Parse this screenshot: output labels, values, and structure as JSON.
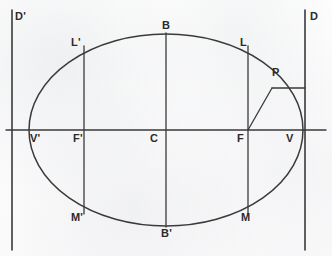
{
  "figure": {
    "width": 332,
    "height": 256,
    "background_color": "#fdfdfd",
    "stroke_color": "#333333",
    "label_color": "#2b2b2b"
  },
  "geometry": {
    "center": {
      "x": 166,
      "y": 130
    },
    "semi_major_axis": 137,
    "semi_minor_axis": 96,
    "major_axis_y": 130,
    "minor_axis_x": 166,
    "focus_right_x": 248,
    "focus_left_x": 84,
    "directrix_right_x": 305,
    "directrix_left_x": 12,
    "directrix_top_y": 10,
    "directrix_bottom_y": 250,
    "point_p": {
      "x": 272,
      "y": 88
    },
    "p_foot_on_directrix": {
      "x": 305,
      "y": 88
    }
  },
  "labels": [
    {
      "id": "D-prime",
      "text": "D'",
      "x": 15,
      "y": 11,
      "name": "label-d-prime"
    },
    {
      "id": "D",
      "text": "D",
      "x": 310,
      "y": 11,
      "name": "label-d"
    },
    {
      "id": "B",
      "text": "B",
      "x": 162,
      "y": 20,
      "name": "label-b"
    },
    {
      "id": "B-prime",
      "text": "B'",
      "x": 161,
      "y": 228,
      "name": "label-b-prime"
    },
    {
      "id": "L-prime",
      "text": "L'",
      "x": 71,
      "y": 37,
      "name": "label-l-prime"
    },
    {
      "id": "L",
      "text": "L",
      "x": 240,
      "y": 37,
      "name": "label-l"
    },
    {
      "id": "M-prime",
      "text": "M'",
      "x": 71,
      "y": 212,
      "name": "label-m-prime"
    },
    {
      "id": "M",
      "text": "M",
      "x": 241,
      "y": 212,
      "name": "label-m"
    },
    {
      "id": "V-prime",
      "text": "V'",
      "x": 30,
      "y": 133,
      "name": "label-v-prime"
    },
    {
      "id": "V",
      "text": "V",
      "x": 286,
      "y": 133,
      "name": "label-v"
    },
    {
      "id": "F-prime",
      "text": "F'",
      "x": 73,
      "y": 133,
      "name": "label-f-prime"
    },
    {
      "id": "F",
      "text": "F",
      "x": 237,
      "y": 133,
      "name": "label-f"
    },
    {
      "id": "C",
      "text": "C",
      "x": 150,
      "y": 133,
      "name": "label-c"
    },
    {
      "id": "P",
      "text": "P",
      "x": 272,
      "y": 67,
      "name": "label-p"
    }
  ],
  "elements": {
    "ellipse": "ellipse-curve",
    "major_axis": "major-axis-line",
    "minor_axis": "minor-axis-line",
    "latus_rectum_right": "latus-rectum-right-chord",
    "latus_rectum_left": "latus-rectum-left-chord",
    "directrix_right": "directrix-right-line",
    "directrix_left": "directrix-left-line",
    "focal_radius": "focal-radius-pf",
    "perpendicular_to_directrix": "perpendicular-p-to-directrix"
  }
}
